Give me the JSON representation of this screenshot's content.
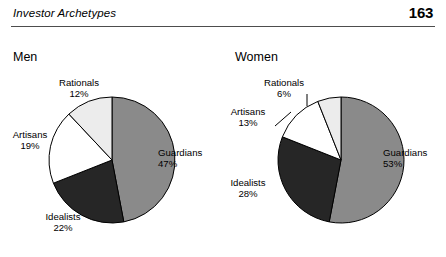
{
  "header": {
    "title": "Investor Archetypes",
    "page_number": "163"
  },
  "charts": [
    {
      "id": "men",
      "title": "Men",
      "labels": {
        "guardians_name": "Guardians",
        "guardians_pct": "47%",
        "idealists_name": "Idealists",
        "idealists_pct": "22%",
        "artisans_name": "Artisans",
        "artisans_pct": "19%",
        "rationals_name": "Rationals",
        "rationals_pct": "12%"
      }
    },
    {
      "id": "women",
      "title": "Women",
      "labels": {
        "guardians_name": "Guardians",
        "guardians_pct": "53%",
        "idealists_name": "Idealists",
        "idealists_pct": "28%",
        "artisans_name": "Artisans",
        "artisans_pct": "13%",
        "rationals_name": "Rationals",
        "rationals_pct": "6%"
      }
    }
  ],
  "colors": {
    "guardians": "#8a8a8a",
    "idealists": "#262626",
    "artisans": "#ffffff",
    "rationals": "#ececec",
    "outline": "#000000",
    "rule": "#4d4d4d",
    "text": "#000000"
  },
  "chart_data": [
    {
      "type": "pie",
      "title": "Men",
      "categories": [
        "Guardians",
        "Idealists",
        "Artisans",
        "Rationals"
      ],
      "values": [
        47,
        22,
        19,
        12
      ],
      "value_unit": "percent",
      "data_labels": [
        "47%",
        "22%",
        "19%",
        "12%"
      ],
      "slice_colors": [
        "#8a8a8a",
        "#262626",
        "#ffffff",
        "#ececec"
      ],
      "start_angle_deg": 0,
      "direction": "clockwise",
      "legend": "none",
      "labels_position": "outside"
    },
    {
      "type": "pie",
      "title": "Women",
      "categories": [
        "Guardians",
        "Idealists",
        "Artisans",
        "Rationals"
      ],
      "values": [
        53,
        28,
        13,
        6
      ],
      "value_unit": "percent",
      "data_labels": [
        "53%",
        "28%",
        "13%",
        "6%"
      ],
      "slice_colors": [
        "#8a8a8a",
        "#262626",
        "#ffffff",
        "#ececec"
      ],
      "start_angle_deg": 0,
      "direction": "clockwise",
      "legend": "none",
      "labels_position": "outside"
    }
  ]
}
